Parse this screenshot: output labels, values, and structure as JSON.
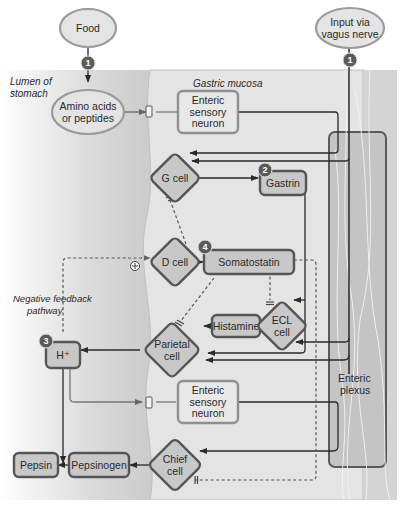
{
  "regions": {
    "lumen": "Lumen of stomach",
    "lumen_lines": [
      "Lumen of",
      "stomach"
    ],
    "mucosa": "Gastric mucosa",
    "plexus_lines": [
      "Enteric",
      "plexus"
    ],
    "feedback_lines": [
      "Negative feedback",
      "pathway"
    ]
  },
  "nodes": {
    "food": {
      "lines": [
        "Food"
      ],
      "shape": "oval"
    },
    "vagus": {
      "lines": [
        "Input via",
        "vagus nerve"
      ],
      "shape": "oval"
    },
    "amino": {
      "lines": [
        "Amino acids",
        "or peptides"
      ],
      "shape": "oval"
    },
    "sensory1": {
      "lines": [
        "Enteric",
        "sensory",
        "neuron"
      ],
      "shape": "rounded-rect"
    },
    "gcell": {
      "lines": [
        "G cell"
      ],
      "shape": "diamond"
    },
    "gastrin": {
      "lines": [
        "Gastrin"
      ],
      "shape": "rounded-rect"
    },
    "dcell": {
      "lines": [
        "D cell"
      ],
      "shape": "diamond"
    },
    "somatostatin": {
      "lines": [
        "Somatostatin"
      ],
      "shape": "rounded-rect"
    },
    "histamine": {
      "lines": [
        "Histamine"
      ],
      "shape": "rounded-rect"
    },
    "ecl": {
      "lines": [
        "ECL",
        "cell"
      ],
      "shape": "diamond"
    },
    "parietal": {
      "lines": [
        "Parietal",
        "cell"
      ],
      "shape": "diamond"
    },
    "hplus": {
      "lines": [
        "H⁺"
      ],
      "shape": "rounded-rect"
    },
    "sensory2": {
      "lines": [
        "Enteric",
        "sensory",
        "neuron"
      ],
      "shape": "rounded-rect"
    },
    "pepsin": {
      "lines": [
        "Pepsin"
      ],
      "shape": "rounded-rect"
    },
    "pepsinogen": {
      "lines": [
        "Pepsinogen"
      ],
      "shape": "rounded-rect"
    },
    "chief": {
      "lines": [
        "Chief",
        "cell"
      ],
      "shape": "diamond"
    }
  },
  "step_badges": [
    "1",
    "1",
    "2",
    "3",
    "4"
  ],
  "symbols": {
    "stimulate": "+",
    "inhibit": "inhibit-bar"
  },
  "colors": {
    "node_fill": "#c8c8c8",
    "node_stroke": "#555555",
    "oval_fill": "#e4e4e4",
    "oval_stroke": "#9a9a9a",
    "sensory_stroke": "#8f8f8f",
    "badge": "#5a5a5a",
    "line": "#2a2a2a",
    "mucosa_bg": "#e2e2e2",
    "lumen_bg": "#d8d8d8",
    "plexus_bg": "#c4c4c4"
  }
}
